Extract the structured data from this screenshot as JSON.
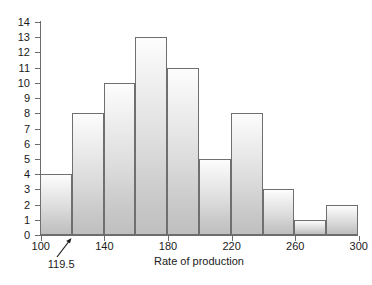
{
  "chart_data": {
    "type": "bar",
    "title": "",
    "xlabel": "Rate of production",
    "ylabel": "",
    "bin_edges": [
      99.5,
      119.5,
      139.5,
      159.5,
      179.5,
      199.5,
      219.5,
      239.5,
      259.5,
      279.5,
      299.5
    ],
    "categories": [
      "99.5-119.5",
      "119.5-139.5",
      "139.5-159.5",
      "159.5-179.5",
      "179.5-199.5",
      "199.5-219.5",
      "219.5-239.5",
      "239.5-259.5",
      "259.5-279.5",
      "279.5-299.5"
    ],
    "values": [
      4,
      8,
      10,
      13,
      11,
      5,
      8,
      3,
      1,
      2
    ],
    "ylim": [
      0,
      14
    ],
    "xlim": [
      99.5,
      299.5
    ],
    "y_ticks": [
      0,
      1,
      2,
      3,
      4,
      5,
      6,
      7,
      8,
      9,
      10,
      11,
      12,
      13,
      14
    ],
    "y_tick_labels": [
      "0",
      "1",
      "2",
      "3",
      "4",
      "5",
      "6",
      "7",
      "8",
      "9",
      "10",
      "11",
      "12",
      "13",
      "14"
    ],
    "x_ticks": [
      100,
      140,
      180,
      220,
      260,
      300
    ],
    "x_tick_labels": [
      "100",
      "140",
      "180",
      "220",
      "260",
      "300"
    ],
    "grid": false,
    "legend": null,
    "bar_fill_top": "#fdfdfd",
    "bar_fill_bottom": "#bfbfbf",
    "bar_border_color": "#6f6f6f",
    "axis_color": "#6b6b6b",
    "text_color": "#1a1a1a",
    "background": "#ffffff",
    "annotations": [
      {
        "text": "119.5",
        "points_to_x": 119.5,
        "points_to_y": 0,
        "style": "arrow"
      }
    ]
  }
}
